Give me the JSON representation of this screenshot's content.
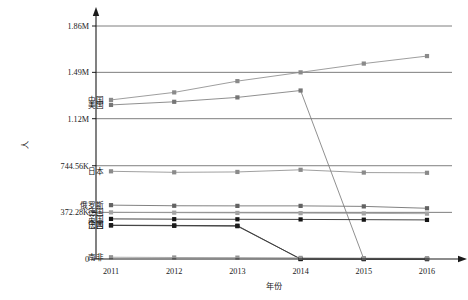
{
  "chart_data": {
    "type": "line",
    "title": "",
    "xlabel": "年份",
    "ylabel": "人",
    "x": [
      "2011",
      "2012",
      "2013",
      "2014",
      "2015",
      "2016"
    ],
    "ylim": [
      0,
      1860000
    ],
    "grid": true,
    "legend_position": "inline-left",
    "ytick_labels": [
      "1.86M",
      "1.49M",
      "1.12M",
      "744.56K",
      "372.28K",
      "0"
    ],
    "ytick_values": [
      1860000,
      1490000,
      1120000,
      744560,
      372280,
      0
    ],
    "series": [
      {
        "name": "中国",
        "color": "#8d8d8d",
        "marker_color": "#8a8a8a",
        "values": [
          1270000,
          1330000,
          1420000,
          1490000,
          1560000,
          1620000
        ]
      },
      {
        "name": "美国",
        "color": "#7c7c7c",
        "marker_color": "#767676",
        "values": [
          1230000,
          1255000,
          1290000,
          1345000,
          0,
          0
        ]
      },
      {
        "name": "日本",
        "color": "#8f8f8f",
        "marker_color": "#8a8a8a",
        "values": [
          700000,
          692000,
          695000,
          712000,
          690000,
          688000
        ]
      },
      {
        "name": "俄罗斯",
        "color": "#6a6a6a",
        "marker_color": "#636363",
        "values": [
          430000,
          425000,
          424000,
          424000,
          420000,
          405000
        ]
      },
      {
        "name": "德国",
        "color": "#9b9b9b",
        "marker_color": "#a3a3a3",
        "values": [
          372280,
          370000,
          368000,
          366000,
          364000,
          362000
        ]
      },
      {
        "name": "英国",
        "color": "#242424",
        "marker_color": "#141414",
        "values": [
          320000,
          318000,
          317000,
          316000,
          314000,
          312000
        ]
      },
      {
        "name": "法国",
        "color": "#2e2e2e",
        "marker_color": "#161616",
        "values": [
          270000,
          268000,
          266000,
          0,
          0,
          0
        ]
      },
      {
        "name": "巴西",
        "color": "#3a3a3a",
        "marker_color": "#1c1c1c",
        "values": [
          268000,
          265000,
          262000,
          0,
          0,
          0
        ]
      },
      {
        "name": "南非",
        "color": "#9a9a9a",
        "marker_color": "#949494",
        "values": [
          14000,
          12000,
          11000,
          9000,
          7000,
          6000
        ]
      }
    ]
  },
  "axis": {
    "y_title": "人",
    "x_title": "年份"
  }
}
